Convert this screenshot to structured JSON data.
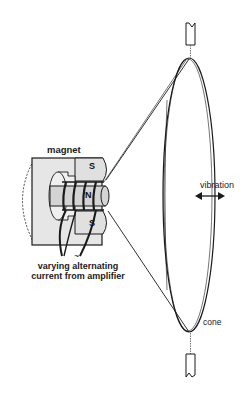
{
  "diagram": {
    "labels": {
      "magnet": "magnet",
      "current": "varying alternating current from amplifier",
      "vibration": "vibration",
      "cone": "cone"
    },
    "poles": {
      "south_top": "S",
      "north": "N",
      "south_bottom": "S"
    },
    "ac_symbol": "~",
    "colors": {
      "line": "#1a1a1a",
      "magnet_fill": "#e6e6e6",
      "core_fill": "#d4d4d4",
      "background": "#ffffff"
    }
  }
}
